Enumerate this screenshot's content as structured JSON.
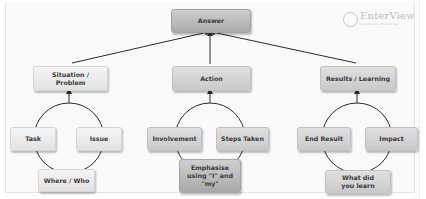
{
  "diagram": {
    "root": {
      "label": "Answer"
    },
    "branches": [
      {
        "label": "Situation / Problem",
        "sub_items": [
          "Task",
          "Issue",
          "Where / Who"
        ]
      },
      {
        "label": "Action",
        "sub_items": [
          "Involvement",
          "Steps Taken",
          "Emphasise using \"I\" and \"my\""
        ]
      },
      {
        "label": "Results / Learning",
        "sub_items": [
          "End Result",
          "Impact",
          "What did you learn"
        ]
      }
    ]
  },
  "logo": {
    "name": "EnterView",
    "tagline": "by Anusha Mohanraj",
    "icon": "growth-chart-circle-icon"
  },
  "colors": {
    "line": "#2b2b2b",
    "box_light": "#e8e8e8",
    "box_mid": "#d2d2d2",
    "box_dark": "#b6b6b6",
    "text": "#3a3a3a"
  }
}
